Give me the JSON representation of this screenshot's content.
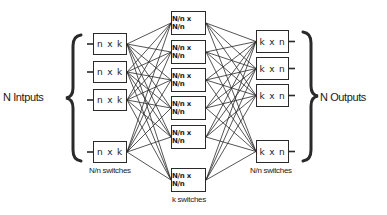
{
  "diagram": {
    "inputs_label": "N Intputs",
    "outputs_label": "N Outputs",
    "stage1": {
      "label": "N/n switches",
      "boxes": [
        {
          "label": "n x k",
          "x": 93,
          "y": 33,
          "w": 34,
          "h": 22
        },
        {
          "label": "n x k",
          "x": 93,
          "y": 61,
          "w": 34,
          "h": 22
        },
        {
          "label": "n x k",
          "x": 93,
          "y": 89,
          "w": 34,
          "h": 22
        },
        {
          "label": "n x k",
          "x": 93,
          "y": 141,
          "w": 34,
          "h": 22
        }
      ]
    },
    "stage2": {
      "label": "k switches",
      "boxes": [
        {
          "label": "N/n x N/n",
          "x": 171,
          "y": 11,
          "w": 35,
          "h": 24
        },
        {
          "label": "N/n x N/n",
          "x": 171,
          "y": 40,
          "w": 35,
          "h": 24
        },
        {
          "label": "N/n x N/n",
          "x": 171,
          "y": 68,
          "w": 35,
          "h": 24
        },
        {
          "label": "N/n x N/n",
          "x": 171,
          "y": 96,
          "w": 35,
          "h": 24
        },
        {
          "label": "N/n x N/n",
          "x": 171,
          "y": 125,
          "w": 35,
          "h": 24
        },
        {
          "label": "N/n x N/n",
          "x": 171,
          "y": 168,
          "w": 35,
          "h": 24
        }
      ]
    },
    "stage3": {
      "label": "N/n switches",
      "boxes": [
        {
          "label": "k x n",
          "x": 256,
          "y": 30,
          "w": 33,
          "h": 23
        },
        {
          "label": "k x n",
          "x": 256,
          "y": 57,
          "w": 33,
          "h": 23
        },
        {
          "label": "k x n",
          "x": 256,
          "y": 84,
          "w": 33,
          "h": 23
        },
        {
          "label": "k x n",
          "x": 256,
          "y": 140,
          "w": 33,
          "h": 23
        }
      ]
    },
    "colors": {
      "line": "#2a2a2a",
      "background": "#ffffff"
    }
  }
}
